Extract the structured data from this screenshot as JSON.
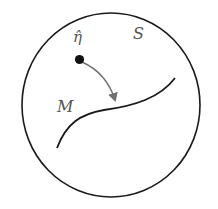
{
  "diagram": {
    "labels": {
      "point": "η̂",
      "space": "S",
      "manifold": "M"
    },
    "colors": {
      "outline": "#1a1a1a",
      "arrow": "#707070",
      "point": "#111111",
      "label": "#555555"
    },
    "elements": [
      {
        "type": "circle",
        "name": "space-S",
        "center": [
          111,
          105
        ],
        "radius": [
          89,
          92
        ]
      },
      {
        "type": "curve",
        "name": "manifold-M",
        "from": [
          57,
          148
        ],
        "to": [
          175,
          78
        ]
      },
      {
        "type": "point",
        "name": "eta-hat",
        "at": [
          80,
          60
        ]
      },
      {
        "type": "arrow",
        "name": "projection",
        "from": [
          80,
          60
        ],
        "to": [
          115,
          107
        ]
      }
    ]
  }
}
